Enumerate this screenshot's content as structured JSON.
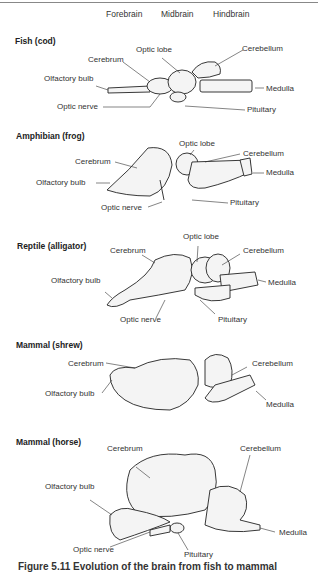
{
  "header": {
    "columns": [
      "Forebrain",
      "Midbrain",
      "Hindbrain"
    ]
  },
  "sections": [
    {
      "title": "Fish (cod)",
      "labels": {
        "cerebrum": "Cerebrum",
        "optic_lobe": "Optic lobe",
        "cerebellum": "Cerebellum",
        "olfactory_bulb": "Olfactory bulb",
        "medulla": "Medulla",
        "optic_nerve": "Optic nerve",
        "pituitary": "Pituitary"
      }
    },
    {
      "title": "Amphibian (frog)",
      "labels": {
        "optic_lobe": "Optic lobe",
        "cerebrum": "Cerebrum",
        "cerebellum": "Cerebellum",
        "medulla": "Medulla",
        "olfactory_bulb": "Olfactory bulb",
        "pituitary": "Pituitary",
        "optic_nerve": "Optic nerve"
      }
    },
    {
      "title": "Reptile (alligator)",
      "labels": {
        "optic_lobe": "Optic lobe",
        "cerebrum": "Cerebrum",
        "cerebellum": "Cerebellum",
        "olfactory_bulb": "Olfactory bulb",
        "medulla": "Medulla",
        "optic_nerve": "Optic nerve",
        "pituitary": "Pituitary"
      }
    },
    {
      "title": "Mammal (shrew)",
      "labels": {
        "cerebrum": "Cerebrum",
        "cerebellum": "Cerebellum",
        "olfactory_bulb": "Olfactory bulb",
        "medulla": "Medulla"
      }
    },
    {
      "title": "Mammal (horse)",
      "labels": {
        "cerebrum": "Cerebrum",
        "cerebellum": "Cerebellum",
        "olfactory_bulb": "Olfactory bulb",
        "medulla": "Medulla",
        "optic_nerve": "Optic nerve",
        "pituitary": "Pituitary"
      }
    }
  ],
  "caption": "Figure 5.11 Evolution of the brain from fish to mammal"
}
